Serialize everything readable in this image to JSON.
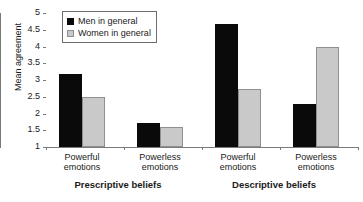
{
  "chart_data": {
    "type": "bar",
    "title": "",
    "xlabel": "",
    "ylabel": "Mean agreement",
    "ylim": [
      1,
      5
    ],
    "ytick_labels": [
      "5",
      "4.5",
      "4",
      "3.5",
      "3",
      "2.5",
      "2",
      "1.5",
      "1"
    ],
    "ytick_values": [
      5,
      4.5,
      4,
      3.5,
      3,
      2.5,
      2,
      1.5,
      1
    ],
    "grid": false,
    "legend_position": "top-left",
    "categories": [
      "Powerful emotions",
      "Powerless emotions",
      "Powerful emotions",
      "Powerless emotions"
    ],
    "group_labels": [
      "Prescriptive beliefs",
      "Descriptive beliefs"
    ],
    "series": [
      {
        "name": "Men in general",
        "color": "#0a0a0a",
        "values": [
          3.18,
          1.71,
          4.67,
          2.28
        ]
      },
      {
        "name": "Women in general",
        "color": "#c9c9c9",
        "values": [
          2.49,
          1.61,
          2.73,
          4.0
        ]
      }
    ]
  },
  "axis": {
    "y_title": "Mean agreement",
    "ticks": [
      {
        "label": "5",
        "value": 5
      },
      {
        "label": "4.5",
        "value": 4.5
      },
      {
        "label": "4",
        "value": 4
      },
      {
        "label": "3.5",
        "value": 3.5
      },
      {
        "label": "3",
        "value": 3
      },
      {
        "label": "2.5",
        "value": 2.5
      },
      {
        "label": "2",
        "value": 2
      },
      {
        "label": "1.5",
        "value": 1.5
      },
      {
        "label": "1",
        "value": 1
      }
    ]
  },
  "legend": {
    "items": [
      {
        "label": "Men in general"
      },
      {
        "label": "Women in general"
      }
    ]
  },
  "categories": [
    {
      "line1": "Powerful",
      "line2": "emotions"
    },
    {
      "line1": "Powerless",
      "line2": "emotions"
    },
    {
      "line1": "Powerful",
      "line2": "emotions"
    },
    {
      "line1": "Powerless",
      "line2": "emotions"
    }
  ],
  "supercategories": [
    {
      "label": "Prescriptive beliefs"
    },
    {
      "label": "Descriptive beliefs"
    }
  ]
}
